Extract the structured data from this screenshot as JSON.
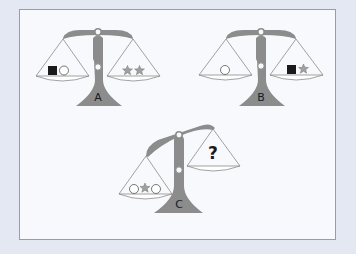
{
  "puzzle": {
    "colors": {
      "background": "#e4e8f3",
      "panel": "#f8f9fc",
      "scale_gray": "#8c8c8c",
      "star_gray": "#a0a0a0",
      "square_black": "#1a1a1a"
    },
    "scales": [
      {
        "label": "A",
        "state": "balanced",
        "left_pan": [
          "black-square",
          "circle"
        ],
        "right_pan": [
          "star",
          "star"
        ]
      },
      {
        "label": "B",
        "state": "balanced",
        "left_pan": [
          "circle"
        ],
        "right_pan": [
          "black-square",
          "star"
        ]
      },
      {
        "label": "C",
        "state": "left-heavy",
        "left_pan": [
          "circle",
          "star",
          "circle"
        ],
        "right_pan": [
          "?"
        ]
      }
    ],
    "question_mark": "?"
  }
}
